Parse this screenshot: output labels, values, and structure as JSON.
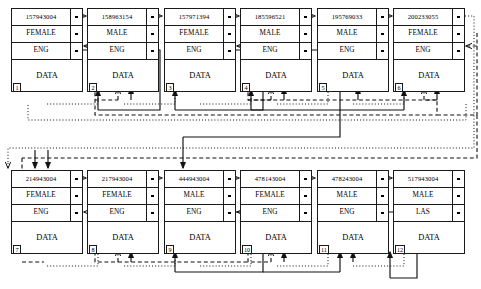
{
  "diagram": {
    "field_labels": [
      "id",
      "gender",
      "language",
      "data"
    ],
    "colors": {
      "ink": "#1a1a1a",
      "paper": "#ffffff"
    },
    "link_styles": {
      "id_chain": "dotted",
      "gender_chain": "dashed",
      "language_chain": "solid"
    },
    "nodes": [
      {
        "index": "1",
        "id": "157943004",
        "gender": "FEMALE",
        "language": "ENG",
        "data": "DATA"
      },
      {
        "index": "2",
        "id": "158963154",
        "gender": "MALE",
        "language": "ENG",
        "data": "DATA"
      },
      {
        "index": "3",
        "id": "157971394",
        "gender": "FEMALE",
        "language": "ENG",
        "data": "DATA"
      },
      {
        "index": "4",
        "id": "185596521",
        "gender": "MALE",
        "language": "ENG",
        "data": "DATA"
      },
      {
        "index": "5",
        "id": "195769033",
        "gender": "MALE",
        "language": "ENG",
        "data": "DATA"
      },
      {
        "index": "6",
        "id": "200233055",
        "gender": "FEMALE",
        "language": "ENG",
        "data": "DATA"
      },
      {
        "index": "7",
        "id": "214943004",
        "gender": "FEMALE",
        "language": "ENG",
        "data": "DATA"
      },
      {
        "index": "8",
        "id": "217943004",
        "gender": "FEMALE",
        "language": "ENG",
        "data": "DATA"
      },
      {
        "index": "9",
        "id": "444943004",
        "gender": "MALE",
        "language": "ENG",
        "data": "DATA"
      },
      {
        "index": "10",
        "id": "478143004",
        "gender": "FEMALE",
        "language": "ENG",
        "data": "DATA"
      },
      {
        "index": "11",
        "id": "478243004",
        "gender": "MALE",
        "language": "ENG",
        "data": "DATA"
      },
      {
        "index": "12",
        "id": "517943004",
        "gender": "MALE",
        "language": "LAS",
        "data": "DATA"
      }
    ]
  }
}
